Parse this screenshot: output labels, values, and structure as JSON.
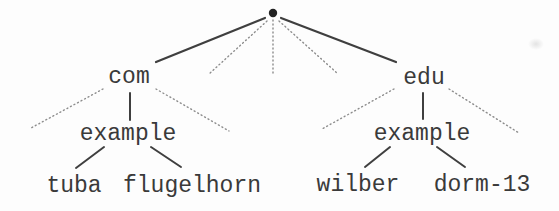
{
  "diagram": {
    "type": "tree",
    "root": {
      "symbol": "dot",
      "label": ""
    },
    "nodes": [
      {
        "id": "com",
        "label": "com",
        "parent": "root"
      },
      {
        "id": "edu",
        "label": "edu",
        "parent": "root"
      },
      {
        "id": "example-com",
        "label": "example",
        "parent": "com"
      },
      {
        "id": "example-edu",
        "label": "example",
        "parent": "edu"
      },
      {
        "id": "tuba",
        "label": "tuba",
        "parent": "example-com"
      },
      {
        "id": "flugelhorn",
        "label": "flugelhorn",
        "parent": "example-com"
      },
      {
        "id": "wilber",
        "label": "wilber",
        "parent": "example-edu"
      },
      {
        "id": "dorm-13",
        "label": "dorm-13",
        "parent": "example-edu"
      }
    ],
    "edges": [
      {
        "from": "root",
        "to": "com",
        "style": "solid"
      },
      {
        "from": "root",
        "to": "unnamed-1",
        "style": "dotted"
      },
      {
        "from": "root",
        "to": "unnamed-2",
        "style": "dotted"
      },
      {
        "from": "root",
        "to": "unnamed-3",
        "style": "dotted"
      },
      {
        "from": "root",
        "to": "edu",
        "style": "solid"
      },
      {
        "from": "com",
        "to": "unnamed-left",
        "style": "dotted"
      },
      {
        "from": "com",
        "to": "example-com",
        "style": "solid"
      },
      {
        "from": "com",
        "to": "unnamed-right",
        "style": "dotted"
      },
      {
        "from": "example-com",
        "to": "tuba",
        "style": "solid"
      },
      {
        "from": "example-com",
        "to": "flugelhorn",
        "style": "solid"
      },
      {
        "from": "edu",
        "to": "unnamed-left",
        "style": "dotted"
      },
      {
        "from": "edu",
        "to": "example-edu",
        "style": "solid"
      },
      {
        "from": "edu",
        "to": "unnamed-right",
        "style": "dotted"
      },
      {
        "from": "example-edu",
        "to": "wilber",
        "style": "solid"
      },
      {
        "from": "example-edu",
        "to": "dorm-13",
        "style": "solid"
      }
    ],
    "colors": {
      "background": "#fdfdfd",
      "text": "#3a3a3a",
      "solid_line": "#3f3f3f",
      "dotted_line": "#8c8c8c",
      "root_dot": "#222222"
    }
  }
}
